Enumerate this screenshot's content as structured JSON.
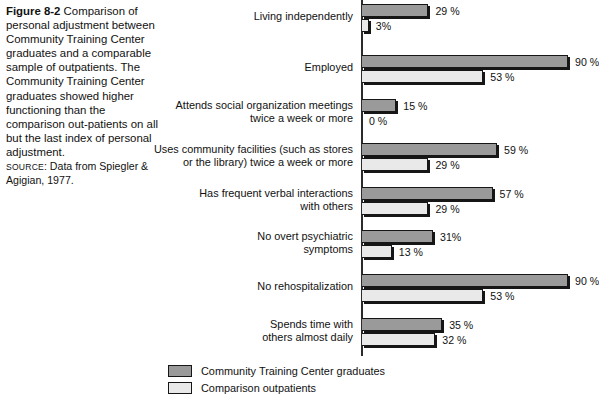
{
  "caption": {
    "figure_number": "Figure 8-2",
    "text": "Comparison of personal adjustment between Community Training Center graduates and a comparable sample of outpatients. The Community Training Center graduates showed higher functioning than the comparison out-patients on all but the last index of personal adjustment.",
    "source_label": "SOURCE",
    "source_text": ": Data from Spiegler & Agigian, 1977."
  },
  "legend": {
    "items": [
      {
        "label": "Community Training Center graduates",
        "color": "#9a9a9a"
      },
      {
        "label": "Comparison outpatients",
        "color": "#e9e9e9"
      }
    ]
  },
  "chart_data": {
    "type": "bar",
    "orientation": "horizontal",
    "title": "Comparison of personal adjustment between Community Training Center graduates and a comparable sample of outpatients",
    "xlabel": "",
    "ylabel": "",
    "xlim": [
      0,
      100
    ],
    "grid": false,
    "legend_position": "bottom",
    "value_suffix": "%",
    "categories": [
      "Living independently",
      "Employed",
      "Attends social organization meetings twice a week or more",
      "Uses community facilities (such as stores or the library) twice a week or more",
      "Has frequent verbal interactions with others",
      "No overt psychiatric symptoms",
      "No rehospitalization",
      "Spends time with others almost daily"
    ],
    "category_lines": [
      [
        "Living independently"
      ],
      [
        "Employed"
      ],
      [
        "Attends social organization meetings",
        "twice a week or more"
      ],
      [
        "Uses community facilities (such as stores",
        "or the library) twice a week or more"
      ],
      [
        "Has frequent verbal interactions",
        "with others"
      ],
      [
        "No overt psychiatric",
        "symptoms"
      ],
      [
        "No rehospitalization"
      ],
      [
        "Spends time with",
        "others almost daily"
      ]
    ],
    "series": [
      {
        "name": "Community Training Center graduates",
        "color": "#9a9a9a",
        "values": [
          29,
          90,
          15,
          59,
          57,
          31,
          90,
          35
        ],
        "labels": [
          "29 %",
          "90 %",
          "15 %",
          "59 %",
          "57 %",
          "31%",
          "90 %",
          "35 %"
        ]
      },
      {
        "name": "Comparison outpatients",
        "color": "#e9e9e9",
        "values": [
          3,
          53,
          0,
          29,
          29,
          13,
          53,
          32
        ],
        "labels": [
          "3%",
          "53 %",
          "0 %",
          "29 %",
          "29 %",
          "13 %",
          "53 %",
          "32 %"
        ]
      }
    ]
  }
}
